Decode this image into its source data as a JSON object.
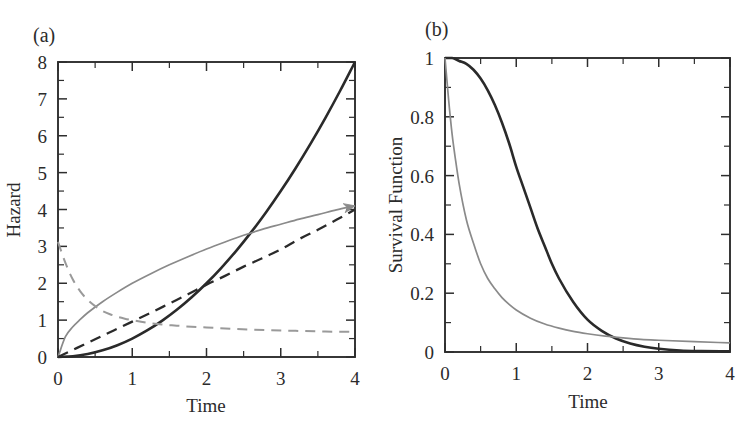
{
  "figure": {
    "width": 752,
    "height": 422,
    "background": "#ffffff",
    "panel_tags": [
      "(a)",
      "(b)"
    ]
  },
  "chart_data": [
    {
      "panel": "(a)",
      "type": "line",
      "title": "",
      "xlabel": "Time",
      "ylabel": "Hazard",
      "xlim": [
        0,
        4
      ],
      "ylim": [
        0,
        8
      ],
      "xticks": [
        0,
        1,
        2,
        3,
        4
      ],
      "xtick_labels": [
        "0",
        "1",
        "2",
        "3",
        "4"
      ],
      "xticks_minor": [
        0.5,
        1.5,
        2.5,
        3.5
      ],
      "yticks": [
        0,
        1,
        2,
        3,
        4,
        5,
        6,
        7,
        8
      ],
      "ytick_labels": [
        "0",
        "1",
        "2",
        "3",
        "4",
        "5",
        "6",
        "7",
        "8"
      ],
      "yticks_minor": [
        0.5,
        1.5,
        2.5,
        3.5,
        4.5,
        5.5,
        6.5,
        7.5
      ],
      "grid": false,
      "legend": "none",
      "annotations": [
        {
          "kind": "arrowhead",
          "at_x": 4.0,
          "at_y": 4.1,
          "on_series": "increasing-concave-gray"
        }
      ],
      "series": [
        {
          "name": "increasing-convex-black",
          "style": "solid",
          "color": "#2a2a2a",
          "width": 2.6,
          "x": [
            0,
            0.2,
            0.4,
            0.6,
            0.8,
            1.0,
            1.2,
            1.4,
            1.6,
            1.8,
            2.0,
            2.2,
            2.4,
            2.6,
            2.8,
            3.0,
            3.2,
            3.4,
            3.6,
            3.8,
            4.0
          ],
          "values": [
            0.0,
            0.02,
            0.08,
            0.18,
            0.32,
            0.5,
            0.72,
            0.98,
            1.28,
            1.62,
            2.0,
            2.42,
            2.88,
            3.38,
            3.92,
            4.5,
            5.12,
            5.78,
            6.48,
            7.22,
            8.0
          ]
        },
        {
          "name": "increasing-concave-gray",
          "style": "solid",
          "color": "#8a8a8a",
          "width": 1.7,
          "x": [
            0,
            0.1,
            0.2,
            0.3,
            0.4,
            0.6,
            0.8,
            1.0,
            1.25,
            1.5,
            1.75,
            2.0,
            2.25,
            2.5,
            2.75,
            3.0,
            3.25,
            3.5,
            3.75,
            4.0
          ],
          "values": [
            0.0,
            0.55,
            0.82,
            1.02,
            1.2,
            1.5,
            1.76,
            2.0,
            2.26,
            2.5,
            2.72,
            2.93,
            3.12,
            3.3,
            3.46,
            3.6,
            3.74,
            3.86,
            3.99,
            4.1
          ]
        },
        {
          "name": "increasing-concave-black-dashed",
          "style": "dashed",
          "color": "#2a2a2a",
          "width": 2.3,
          "dash": "11,7",
          "x": [
            0,
            0.25,
            0.5,
            0.75,
            1.0,
            1.25,
            1.5,
            1.75,
            2.0,
            2.25,
            2.5,
            2.75,
            3.0,
            3.25,
            3.5,
            3.75,
            4.0
          ],
          "values": [
            0.0,
            0.24,
            0.48,
            0.72,
            0.96,
            1.2,
            1.45,
            1.7,
            1.96,
            2.2,
            2.45,
            2.68,
            2.92,
            3.2,
            3.45,
            3.72,
            4.0
          ]
        },
        {
          "name": "decreasing-gray-dashed",
          "style": "dashed",
          "color": "#9a9a9a",
          "width": 2.0,
          "dash": "10,7",
          "x": [
            0,
            0.1,
            0.2,
            0.3,
            0.4,
            0.5,
            0.6,
            0.7,
            0.8,
            0.9,
            1.0,
            1.2,
            1.4,
            1.6,
            1.8,
            2.0,
            2.4,
            2.8,
            3.2,
            3.6,
            4.0
          ],
          "values": [
            3.12,
            2.55,
            2.1,
            1.78,
            1.55,
            1.38,
            1.25,
            1.16,
            1.09,
            1.04,
            1.0,
            0.93,
            0.88,
            0.85,
            0.82,
            0.8,
            0.76,
            0.73,
            0.71,
            0.69,
            0.68
          ]
        }
      ]
    },
    {
      "panel": "(b)",
      "type": "line",
      "title": "",
      "xlabel": "Time",
      "ylabel": "Survival Function",
      "xlim": [
        0,
        4
      ],
      "ylim": [
        0,
        1
      ],
      "xticks": [
        0,
        1,
        2,
        3,
        4
      ],
      "xtick_labels": [
        "0",
        "1",
        "2",
        "3",
        "4"
      ],
      "xticks_minor": [
        0.5,
        1.5,
        2.5,
        3.5
      ],
      "yticks": [
        0,
        0.2,
        0.4,
        0.6,
        0.8,
        1
      ],
      "ytick_labels": [
        "0",
        "0.2",
        "0.4",
        "0.6",
        "0.8",
        "1"
      ],
      "yticks_minor": [
        0.1,
        0.3,
        0.5,
        0.7,
        0.9
      ],
      "grid": false,
      "legend": "none",
      "annotations": [],
      "series": [
        {
          "name": "weibull-survival-black",
          "style": "solid",
          "color": "#2a2a2a",
          "width": 2.6,
          "x": [
            0,
            0.1,
            0.2,
            0.3,
            0.4,
            0.5,
            0.6,
            0.7,
            0.8,
            0.9,
            1.0,
            1.1,
            1.2,
            1.3,
            1.4,
            1.5,
            1.6,
            1.8,
            2.0,
            2.2,
            2.4,
            2.6,
            2.8,
            3.0,
            3.3,
            3.6,
            4.0
          ],
          "values": [
            1.0,
            1.0,
            0.99,
            0.98,
            0.96,
            0.93,
            0.89,
            0.84,
            0.78,
            0.71,
            0.63,
            0.56,
            0.49,
            0.42,
            0.36,
            0.3,
            0.25,
            0.17,
            0.11,
            0.072,
            0.046,
            0.029,
            0.018,
            0.011,
            0.005,
            0.003,
            0.002
          ]
        },
        {
          "name": "exponential-survival-gray",
          "style": "solid",
          "color": "#8a8a8a",
          "width": 1.7,
          "x": [
            0,
            0.05,
            0.1,
            0.15,
            0.2,
            0.3,
            0.4,
            0.5,
            0.6,
            0.7,
            0.8,
            0.9,
            1.0,
            1.2,
            1.4,
            1.6,
            1.8,
            2.0,
            2.25,
            2.5,
            2.75,
            3.0,
            3.5,
            4.0
          ],
          "values": [
            1.0,
            0.86,
            0.74,
            0.65,
            0.57,
            0.45,
            0.37,
            0.3,
            0.25,
            0.215,
            0.185,
            0.162,
            0.143,
            0.115,
            0.095,
            0.081,
            0.07,
            0.062,
            0.054,
            0.048,
            0.043,
            0.04,
            0.035,
            0.031
          ]
        }
      ]
    }
  ]
}
